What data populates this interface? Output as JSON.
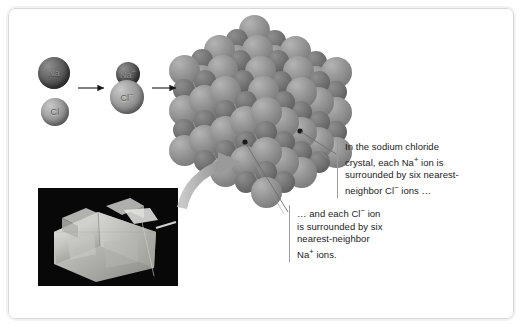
{
  "figure": {
    "background_color": "#ffffff",
    "border_color": "#d8d8d8"
  },
  "reactants": {
    "sodium_atom": {
      "label": "Na",
      "charge": "",
      "color": "#4e4e4e",
      "kind": "dark-sphere"
    },
    "chlorine_atom": {
      "label": "Cl",
      "charge": "",
      "color": "#8a8a8a",
      "kind": "light-sphere"
    },
    "sodium_ion": {
      "label": "Na",
      "charge": "+",
      "color": "#4e4e4e",
      "kind": "dark-sphere"
    },
    "chloride_ion": {
      "label": "Cl",
      "charge": "−",
      "color": "#8a8a8a",
      "kind": "light-sphere"
    }
  },
  "arrows": {
    "arrow_one": {
      "name": "electron-transfer-arrow",
      "style": "thin-black"
    },
    "arrow_two": {
      "name": "lattice-formation-arrow",
      "style": "thin-black"
    },
    "photo_arrow": {
      "name": "curved-arrow-to-lattice",
      "style": "thick-gray-curved"
    }
  },
  "lattice": {
    "name": "sodium-chloride-crystal-lattice",
    "description": "Cubic close-packed array of alternating large chloride ions and small sodium ions",
    "large_ion_color": "#828282",
    "small_ion_color": "#656565"
  },
  "photo": {
    "name": "halite-crystal-photograph",
    "description": "Photograph of a cubic halite (rock salt) crystal on a black background",
    "background_color": "#080808"
  },
  "callouts": {
    "sodium": {
      "lines": [
        "In the sodium chloride",
        "crystal, each Na",
        "surrounded by six nearest-",
        "neighbor Cl"
      ],
      "line2_prefix": "crystal, each Na",
      "line2_sup": "+",
      "line2_suffix": " ion is",
      "line4_prefix": "neighbor Cl",
      "line4_sup": "−",
      "line4_suffix": " ions …"
    },
    "chloride": {
      "line1_prefix": "… and each Cl",
      "line1_sup": "−",
      "line1_suffix": " ion",
      "line2": "is surrounded by six",
      "line3": "nearest-neighbor",
      "line4_prefix": "Na",
      "line4_sup": "+",
      "line4_suffix": " ions."
    }
  }
}
